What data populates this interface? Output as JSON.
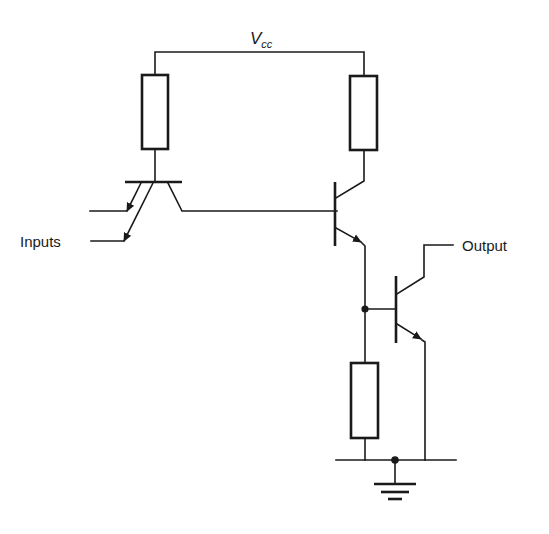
{
  "diagram": {
    "type": "circuit-schematic",
    "labels": {
      "supply_main": "V",
      "supply_sub": "cc",
      "inputs": "Inputs",
      "output": "Output"
    },
    "components": [
      {
        "id": "R1",
        "kind": "resistor",
        "position": "top-left"
      },
      {
        "id": "R2",
        "kind": "resistor",
        "position": "top-right"
      },
      {
        "id": "R3",
        "kind": "resistor",
        "position": "bottom"
      },
      {
        "id": "T1",
        "kind": "multi-emitter-npn-transistor",
        "emitters": 2
      },
      {
        "id": "T2",
        "kind": "npn-transistor",
        "role": "driver"
      },
      {
        "id": "T3",
        "kind": "npn-transistor",
        "role": "output"
      },
      {
        "id": "GND",
        "kind": "ground"
      }
    ],
    "colors": {
      "line": "#1a1a1a",
      "background": "#ffffff"
    }
  }
}
